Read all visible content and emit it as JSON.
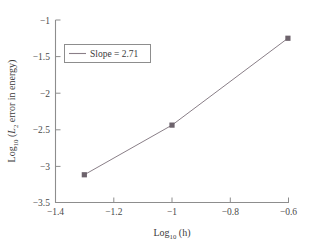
{
  "chart_data": {
    "type": "line",
    "title": "",
    "subtitle": "",
    "xlabel": "Log10 (h)",
    "ylabel": "Log10 (L2 error in energy)",
    "xlabel_parts": {
      "base": "Log",
      "base_sub": "10",
      "arg": " (h)"
    },
    "ylabel_parts": {
      "base": "Log",
      "base_sub": "10",
      "open": " (",
      "var": "L",
      "var_sub": "2",
      "rest": " error in energy)"
    },
    "xlim": [
      -1.4,
      -0.6
    ],
    "ylim": [
      -3.5,
      -1.0
    ],
    "xticks": [
      -1.4,
      -1.2,
      -1.0,
      -0.8,
      -0.6
    ],
    "xtick_labels": [
      "−1.4",
      "−1.2",
      "−1",
      "−0.8",
      "−0.6"
    ],
    "yticks": [
      -1.0,
      -1.5,
      -2.0,
      -2.5,
      -3.0,
      -3.5
    ],
    "ytick_labels": [
      "−1",
      "−1.5",
      "−2",
      "−2.5",
      "−3",
      "−3.5"
    ],
    "grid": false,
    "legend_position": "upper-left",
    "series": [
      {
        "name": "Slope = 2.71",
        "x": [
          -1.301,
          -1.0,
          -0.602
        ],
        "y": [
          -3.12,
          -2.44,
          -1.25
        ],
        "color": "#8a7f88",
        "marker": "square",
        "marker_color": "#6d636c",
        "line_width": 1
      }
    ],
    "legend_entries": [
      "Slope = 2.71"
    ],
    "slope_value": "2.71",
    "annotations": []
  },
  "figure": {
    "background_color": "#ffffff",
    "axis_color": "#8d8d8d",
    "text_color": "#3b3b3b",
    "legend_border_color": "#8d8d8d"
  }
}
